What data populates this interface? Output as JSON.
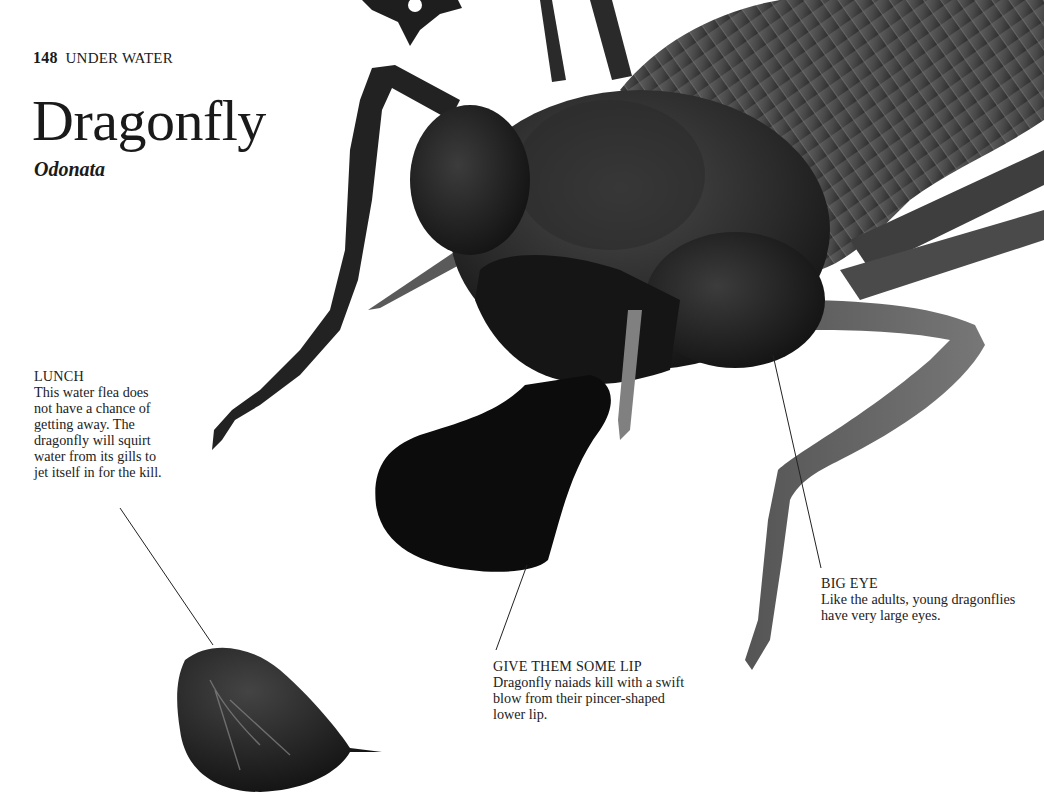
{
  "page": {
    "number": "148",
    "section": "UNDER WATER"
  },
  "header": {
    "title": "Dragonfly",
    "scientific_name": "Odonata"
  },
  "captions": [
    {
      "id": "lunch",
      "heading": "LUNCH",
      "text": "This water flea does not have a chance of getting away. The dragonfly will squirt water from its gills to jet itself in for the kill."
    },
    {
      "id": "lip",
      "heading": "GIVE THEM SOME LIP",
      "text": "Dragonfly naiads kill with a swift blow from their pincer-shaped lower lip."
    },
    {
      "id": "eye",
      "heading": "BIG EYE",
      "text": "Like the adults, young dragonflies have very large eyes."
    }
  ],
  "images": {
    "main": "dragonfly-naiad-micrograph",
    "secondary": "water-flea-micrograph"
  },
  "colors": {
    "background": "#ffffff",
    "text": "#1a1a1a",
    "insect_dark": "#141414",
    "insect_mid": "#3a3a3a",
    "insect_light": "#6a6a6a"
  }
}
